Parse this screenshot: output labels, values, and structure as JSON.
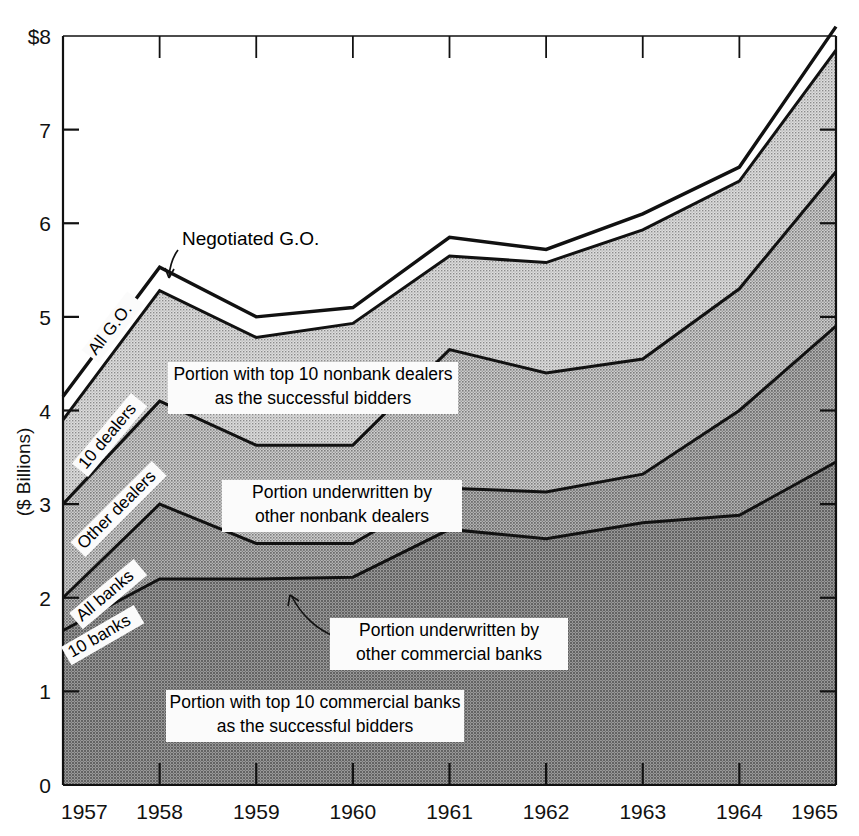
{
  "chart_data": {
    "type": "area",
    "title": "",
    "xlabel": "",
    "ylabel": "($ Billions)",
    "ylim": [
      0,
      8
    ],
    "xlim": [
      1957,
      1965
    ],
    "grid": false,
    "legend_position": "inline-annotations",
    "axis_top_label": "$8",
    "y_ticks": [
      "0",
      "1",
      "2",
      "3",
      "4",
      "5",
      "6",
      "7",
      "$8"
    ],
    "y_tick_values": [
      0,
      1,
      2,
      3,
      4,
      5,
      6,
      7,
      8
    ],
    "categories": [
      1957,
      1958,
      1959,
      1960,
      1961,
      1962,
      1963,
      1964,
      1965
    ],
    "x_tick_labels": [
      "1957",
      "1958",
      "1959",
      "1960",
      "1961",
      "1962",
      "1963",
      "1964",
      "1965"
    ],
    "stacking": "cumulative-lines",
    "series": [
      {
        "name": "10 banks",
        "label": "10 banks",
        "values": [
          1.65,
          2.2,
          2.2,
          2.22,
          2.73,
          2.63,
          2.8,
          2.88,
          3.45
        ],
        "fill": "#8e8e8e"
      },
      {
        "name": "All banks",
        "label": "All banks",
        "values": [
          2.0,
          3.0,
          2.58,
          2.58,
          3.17,
          3.13,
          3.32,
          4.0,
          4.9
        ],
        "fill": "#a8a8a8"
      },
      {
        "name": "Other dealers",
        "label": "Other dealers",
        "values": [
          3.0,
          4.1,
          3.63,
          3.63,
          4.65,
          4.4,
          4.55,
          5.3,
          6.55
        ],
        "fill": "#bdbdbd"
      },
      {
        "name": "10 dealers",
        "label": "10 dealers",
        "values": [
          3.9,
          5.28,
          4.78,
          4.93,
          5.65,
          5.58,
          5.93,
          6.45,
          7.85
        ],
        "fill": "#e2e2e2"
      },
      {
        "name": "All G.O.",
        "label": "All G.O.",
        "values": [
          4.15,
          5.53,
          5.0,
          5.1,
          5.85,
          5.72,
          6.1,
          6.6,
          8.1
        ],
        "fill": "#ffffff"
      }
    ],
    "annotations": [
      {
        "id": "negotiated-go",
        "text": "Negotiated G.O.",
        "kind": "pointer-label"
      },
      {
        "id": "all-go",
        "text": "All G.O.",
        "kind": "rotated-boundary-label"
      },
      {
        "id": "ten-dealers",
        "text": "10 dealers",
        "kind": "rotated-boundary-label"
      },
      {
        "id": "other-dealers",
        "text": "Other dealers",
        "kind": "rotated-boundary-label"
      },
      {
        "id": "all-banks",
        "text": "All banks",
        "kind": "rotated-boundary-label"
      },
      {
        "id": "ten-banks",
        "text": "10 banks",
        "kind": "rotated-boundary-label"
      },
      {
        "id": "band-top10-nonbank",
        "line1": "Portion with top 10 nonbank dealers",
        "line2": "as the successful bidders",
        "kind": "band-callout"
      },
      {
        "id": "band-other-nonbank",
        "line1": "Portion underwritten by",
        "line2": "other nonbank dealers",
        "kind": "band-callout"
      },
      {
        "id": "band-other-commercial",
        "line1": "Portion underwritten by",
        "line2": "other commercial banks",
        "kind": "band-callout-pointer"
      },
      {
        "id": "band-top10-commercial",
        "line1": "Portion with top 10 commercial banks",
        "line2": "as the successful bidders",
        "kind": "band-callout"
      }
    ]
  },
  "colors": {
    "ink": "#111111",
    "band_10_banks": "#8e8e8e",
    "band_all_banks": "#a8a8a8",
    "band_other_dealers": "#bdbdbd",
    "band_10_dealers": "#e2e2e2",
    "band_all_go": "#ffffff",
    "callout_bg": "#f7f7f7"
  }
}
